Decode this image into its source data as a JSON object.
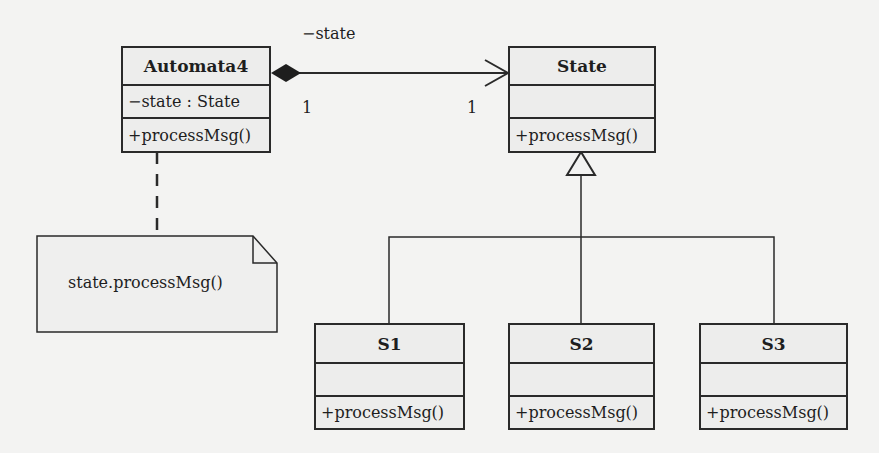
{
  "diagram": {
    "type": "UML class diagram (State pattern)",
    "classes": [
      {
        "id": "automata4",
        "name": "Automata4",
        "attributes": [
          "−state : State"
        ],
        "operations": [
          "+processMsg()"
        ]
      },
      {
        "id": "state",
        "name": "State",
        "attributes": [],
        "operations": [
          "+processMsg()"
        ]
      },
      {
        "id": "s1",
        "name": "S1",
        "attributes": [],
        "operations": [
          "+processMsg()"
        ]
      },
      {
        "id": "s2",
        "name": "S2",
        "attributes": [],
        "operations": [
          "+processMsg()"
        ]
      },
      {
        "id": "s3",
        "name": "S3",
        "attributes": [],
        "operations": [
          "+processMsg()"
        ]
      }
    ],
    "association": {
      "from": "Automata4",
      "to": "State",
      "kind": "composition",
      "role": "−state",
      "from_multiplicity": "1",
      "to_multiplicity": "1"
    },
    "generalizations": [
      {
        "child": "S1",
        "parent": "State"
      },
      {
        "child": "S2",
        "parent": "State"
      },
      {
        "child": "S3",
        "parent": "State"
      }
    ],
    "note": {
      "text": "state.processMsg()",
      "attached_to": "Automata4"
    }
  }
}
